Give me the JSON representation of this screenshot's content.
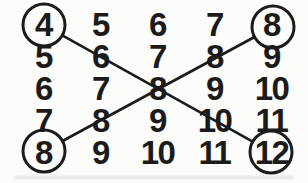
{
  "figure": {
    "type": "addition-table-diagram",
    "ink_color": "#1b1b1b",
    "background_color": "#fcfcfa",
    "grid": {
      "rows": [
        [
          "4",
          "5",
          "6",
          "7",
          "8"
        ],
        [
          "5",
          "6",
          "7",
          "8",
          "9"
        ],
        [
          "6",
          "7",
          "8",
          "9",
          "10"
        ],
        [
          "7",
          "8",
          "9",
          "10",
          "11"
        ],
        [
          "8",
          "9",
          "10",
          "11",
          "12"
        ]
      ]
    },
    "annotations": {
      "circled_values": [
        {
          "row": 0,
          "col": 0,
          "value": "4",
          "position": "top-left"
        },
        {
          "row": 0,
          "col": 4,
          "value": "8",
          "position": "top-right"
        },
        {
          "row": 4,
          "col": 0,
          "value": "8",
          "position": "bottom-left"
        },
        {
          "row": 4,
          "col": 4,
          "value": "12",
          "position": "bottom-right"
        }
      ],
      "lines": [
        {
          "from_value": "4",
          "from_position": "top-left",
          "to_value": "12",
          "to_position": "bottom-right",
          "passes_through": [
            "6",
            "8",
            "10"
          ]
        },
        {
          "from_value": "8",
          "from_position": "bottom-left",
          "to_value": "8",
          "to_position": "top-right",
          "passes_through": [
            "8",
            "8",
            "8"
          ]
        }
      ]
    }
  }
}
